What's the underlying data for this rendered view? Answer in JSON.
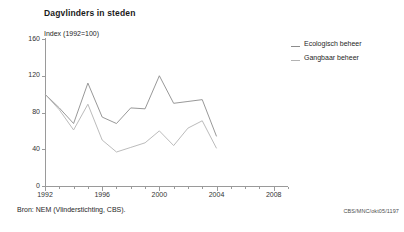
{
  "title": "Dagvlinders in steden",
  "subtitle": "Index (1992=100)",
  "source_note": "Bron: NEM (Vlinderstichting, CBS).",
  "figure_code": "CBS/MNC/okt05/1197",
  "legend": {
    "position": "right",
    "entries": [
      {
        "label": "Ecologisch beheer",
        "color": "#8c8c8c"
      },
      {
        "label": "Gangbaar beheer",
        "color": "#b3b3b3"
      }
    ]
  },
  "axis_color": "#9a9a9a",
  "chart_data": {
    "type": "line",
    "title": "Dagvlinders in steden",
    "subtitle": "Index (1992=100)",
    "xlabel": "",
    "ylabel": "Index (1992=100)",
    "xlim": [
      1992,
      2009
    ],
    "ylim": [
      0,
      160
    ],
    "ytick_labels": [
      "0",
      "40",
      "80",
      "120",
      "160"
    ],
    "yticks": [
      0,
      40,
      80,
      120,
      160
    ],
    "xtick_labels": [
      "1992",
      "1996",
      "2000",
      "2004",
      "2008"
    ],
    "xticks": [
      1992,
      1996,
      2000,
      2004,
      2008
    ],
    "minor_xticks": [
      1993,
      1994,
      1995,
      1997,
      1998,
      1999,
      2001,
      2002,
      2003,
      2005,
      2006,
      2007,
      2009
    ],
    "grid": false,
    "x": [
      1992,
      1993,
      1994,
      1995,
      1996,
      1997,
      1998,
      1999,
      2000,
      2001,
      2002,
      2003,
      2004
    ],
    "series": [
      {
        "name": "Ecologisch beheer",
        "color": "#8c8c8c",
        "values": [
          100,
          85,
          68,
          112,
          75,
          68,
          85,
          84,
          120,
          90,
          92,
          94,
          54
        ]
      },
      {
        "name": "Gangbaar beheer",
        "color": "#b3b3b3",
        "values": [
          100,
          83,
          61,
          89,
          50,
          37,
          42,
          47,
          60,
          44,
          63,
          71,
          41
        ]
      }
    ]
  }
}
